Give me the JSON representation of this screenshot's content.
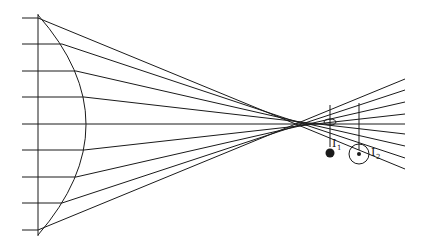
{
  "diagram": {
    "labels": {
      "image1": "I",
      "image1_sub": "1",
      "image2": "I",
      "image2_sub": "2"
    },
    "lens": {
      "flat_x": 38,
      "top_y": 15,
      "bottom_y": 235,
      "bulge_x": 86
    },
    "rays": [
      {
        "y": 18,
        "exit_x": 38,
        "end": [
          405,
          166
        ]
      },
      {
        "y": 44,
        "exit_x": 62,
        "end": [
          405,
          160
        ]
      },
      {
        "y": 71,
        "exit_x": 76,
        "end": [
          405,
          148
        ]
      },
      {
        "y": 97,
        "exit_x": 84,
        "end": [
          405,
          135
        ]
      },
      {
        "y": 124,
        "exit_x": 86,
        "end": [
          405,
          124
        ]
      },
      {
        "y": 150,
        "exit_x": 84,
        "end": [
          405,
          113
        ]
      },
      {
        "y": 177,
        "exit_x": 76,
        "end": [
          405,
          100
        ]
      },
      {
        "y": 203,
        "exit_x": 62,
        "end": [
          405,
          88
        ]
      },
      {
        "y": 230,
        "exit_x": 38,
        "end": [
          405,
          82
        ]
      }
    ],
    "colors": {
      "line": "#1a1a1a",
      "background": "#ffffff"
    }
  }
}
